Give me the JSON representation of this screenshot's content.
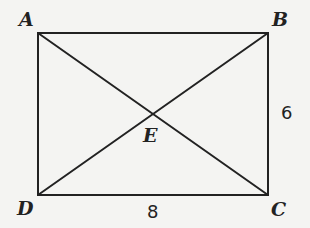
{
  "figure": {
    "type": "rectangle-with-diagonals",
    "stroke_color": "#222222",
    "background_color": "#f4f4f2",
    "vertices": {
      "A": {
        "label": "A",
        "x": 38,
        "y": 33
      },
      "B": {
        "label": "B",
        "x": 268,
        "y": 33
      },
      "C": {
        "label": "C",
        "x": 268,
        "y": 195
      },
      "D": {
        "label": "D",
        "x": 38,
        "y": 195
      },
      "E": {
        "label": "E",
        "x": 153,
        "y": 114
      }
    },
    "segments": [
      {
        "from": "A",
        "to": "B"
      },
      {
        "from": "B",
        "to": "C"
      },
      {
        "from": "C",
        "to": "D"
      },
      {
        "from": "D",
        "to": "A"
      },
      {
        "from": "A",
        "to": "C"
      },
      {
        "from": "B",
        "to": "D"
      }
    ],
    "measurements": {
      "BC": "6",
      "DC": "8"
    }
  }
}
